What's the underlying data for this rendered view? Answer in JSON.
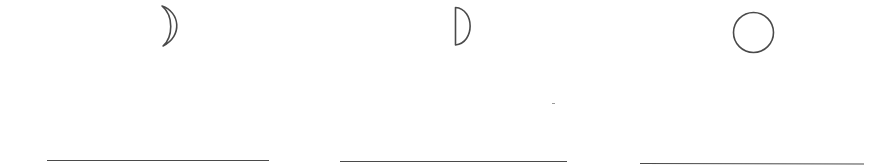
{
  "worksheet": {
    "title": "",
    "items": [
      {
        "index": 1,
        "shape": "waxing-crescent",
        "icon": "crescent-moon-icon",
        "answer": ""
      },
      {
        "index": 2,
        "shape": "first-quarter-half-moon",
        "icon": "half-moon-icon",
        "answer": ""
      },
      {
        "index": 3,
        "shape": "full-moon",
        "icon": "full-moon-circle-icon",
        "answer": ""
      }
    ]
  },
  "colors": {
    "stroke": "#4a4a4a",
    "background": "#ffffff"
  }
}
